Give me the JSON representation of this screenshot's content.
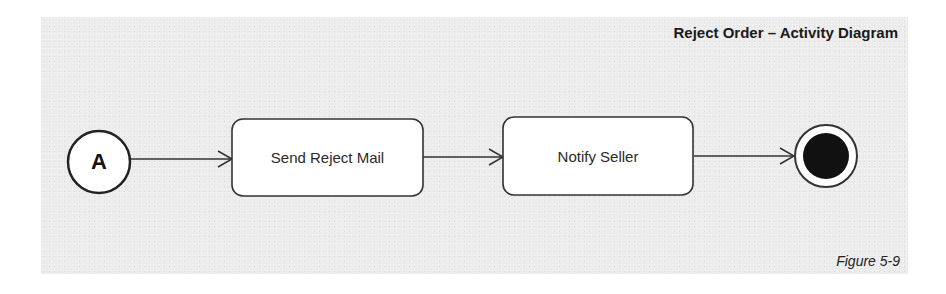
{
  "diagram": {
    "title": "Reject Order – Activity Diagram",
    "caption": "Figure 5-9",
    "type": "UML activity diagram",
    "nodes": [
      {
        "id": "A",
        "kind": "connector",
        "label": "A"
      },
      {
        "id": "send_reject_mail",
        "kind": "action",
        "label": "Send Reject Mail"
      },
      {
        "id": "notify_seller",
        "kind": "action",
        "label": "Notify Seller"
      },
      {
        "id": "end",
        "kind": "final",
        "label": ""
      }
    ],
    "edges": [
      {
        "from": "A",
        "to": "send_reject_mail"
      },
      {
        "from": "send_reject_mail",
        "to": "notify_seller"
      },
      {
        "from": "notify_seller",
        "to": "end"
      }
    ]
  },
  "colors": {
    "background": "#ececec",
    "node_fill": "#ffffff",
    "stroke": "#333333",
    "final_fill": "#111111"
  }
}
